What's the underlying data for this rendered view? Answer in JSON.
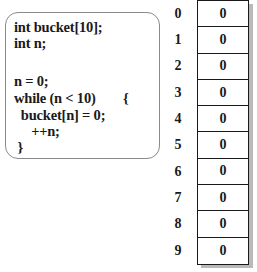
{
  "code": {
    "lines": [
      "int bucket[10];",
      "int n;",
      "",
      "n = 0;",
      "while (n < 10)        {",
      "  bucket[n] = 0;",
      "     ++n;",
      " }"
    ]
  },
  "array": {
    "name": "bucket",
    "indices": [
      "0",
      "1",
      "2",
      "3",
      "4",
      "5",
      "6",
      "7",
      "8",
      "9"
    ],
    "values": [
      "0",
      "0",
      "0",
      "0",
      "0",
      "0",
      "0",
      "0",
      "0",
      "0"
    ]
  }
}
